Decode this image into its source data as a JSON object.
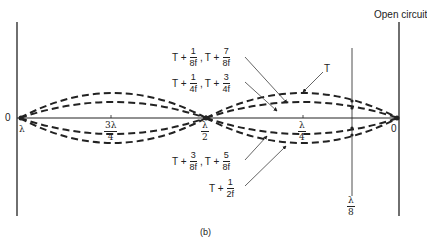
{
  "figure": {
    "caption": "(b)",
    "open_circuit_label": "Open circuit",
    "node_left_label": "0",
    "node_right_label": "0",
    "lambda_label": "λ",
    "position_labels": {
      "three_lambda_over_4": {
        "num": "3λ",
        "den": "4"
      },
      "lambda_over_2": {
        "num": "λ",
        "den": "2"
      },
      "lambda_over_4": {
        "num": "λ",
        "den": "4"
      },
      "lambda_over_8": {
        "num": "λ",
        "den": "8"
      }
    },
    "time_labels": {
      "upper_outer": {
        "prefix1": "T +",
        "f1": {
          "num": "1",
          "den": "8f"
        },
        "sep": ",",
        "prefix2": "T +",
        "f2": {
          "num": "7",
          "den": "8f"
        }
      },
      "upper_inner": {
        "prefix1": "T +",
        "f1": {
          "num": "1",
          "den": "4f"
        },
        "sep": ",",
        "prefix2": "T +",
        "f2": {
          "num": "3",
          "den": "4f"
        }
      },
      "peak": "T",
      "lower_inner": {
        "prefix1": "T +",
        "f1": {
          "num": "3",
          "den": "8f"
        },
        "sep": ",",
        "prefix2": "T +",
        "f2": {
          "num": "5",
          "den": "8f"
        }
      },
      "lower_outer": {
        "prefix": "T +",
        "f": {
          "num": "1",
          "den": "2f"
        }
      }
    },
    "colors": {
      "line": "#222222",
      "background": "#ffffff"
    }
  }
}
